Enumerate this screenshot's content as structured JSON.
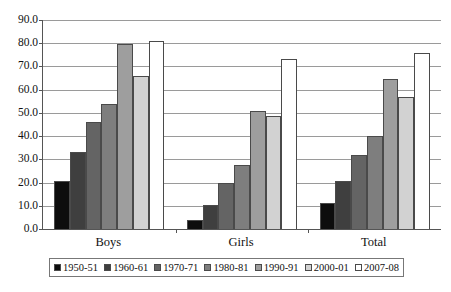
{
  "chart_data": {
    "type": "bar",
    "title": "",
    "xlabel": "",
    "ylabel": "",
    "categories": [
      "Boys",
      "Girls",
      "Total"
    ],
    "series": [
      {
        "name": "1950-51",
        "color": "#0d0d0d",
        "values": [
          20.5,
          3.9,
          11.0
        ]
      },
      {
        "name": "1960-61",
        "color": "#3f3f3f",
        "values": [
          33.0,
          10.5,
          20.8
        ]
      },
      {
        "name": "1970-71",
        "color": "#646464",
        "values": [
          46.0,
          19.8,
          31.7
        ]
      },
      {
        "name": "1980-81",
        "color": "#7e7e7e",
        "values": [
          53.7,
          27.6,
          40.2
        ]
      },
      {
        "name": "1990-91",
        "color": "#9e9e9e",
        "values": [
          79.6,
          50.8,
          64.8
        ]
      },
      {
        "name": "2000-01",
        "color": "#d2d2d2",
        "values": [
          66.0,
          48.6,
          56.8
        ]
      },
      {
        "name": "2007-08",
        "color": "#ffffff",
        "values": [
          81.0,
          73.0,
          76.0
        ]
      }
    ],
    "ylim": [
      0.0,
      90.0
    ],
    "ytick_step": 10.0,
    "ytick_labels": [
      "90.0",
      "80.0",
      "70.0",
      "60.0",
      "50.0",
      "40.0",
      "30.0",
      "20.0",
      "10.0",
      "0.0"
    ],
    "grid": true,
    "legend_position": "bottom"
  }
}
